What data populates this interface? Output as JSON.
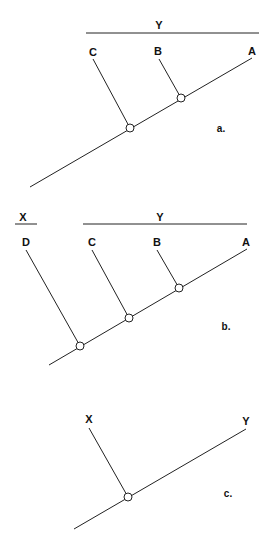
{
  "diagrams": {
    "a": {
      "panel_label": "a.",
      "group_label": "Y",
      "taxa": [
        "C",
        "B",
        "A"
      ]
    },
    "b": {
      "panel_label": "b.",
      "group_labels": [
        "X",
        "Y"
      ],
      "taxa": [
        "D",
        "C",
        "B",
        "A"
      ]
    },
    "c": {
      "panel_label": "c.",
      "taxa": [
        "X",
        "Y"
      ]
    }
  },
  "colors": {
    "line": "#222222",
    "background": "#ffffff"
  }
}
